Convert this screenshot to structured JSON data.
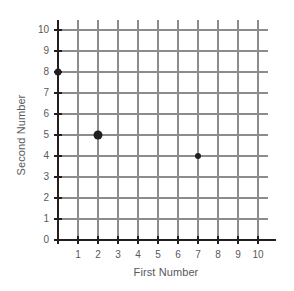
{
  "chart_data": {
    "type": "scatter",
    "title": "",
    "xlabel": "First Number",
    "ylabel": "Second Number",
    "xlim": [
      0,
      10
    ],
    "ylim": [
      0,
      10
    ],
    "xticks": [
      0,
      1,
      2,
      3,
      4,
      5,
      6,
      7,
      8,
      9,
      10
    ],
    "yticks": [
      0,
      1,
      2,
      3,
      4,
      5,
      6,
      7,
      8,
      9,
      10
    ],
    "xtick_labels": [
      "0",
      "1",
      "2",
      "3",
      "4",
      "5",
      "6",
      "7",
      "8",
      "9",
      "10"
    ],
    "ytick_labels": [
      "0",
      "1",
      "2",
      "3",
      "4",
      "5",
      "6",
      "7",
      "8",
      "9",
      "10"
    ],
    "grid": true,
    "legend": "none",
    "points": [
      {
        "x": 0,
        "y": 8,
        "marker": "filled-circle",
        "size": 7,
        "color": "#231f20",
        "label": "(0, 8)"
      },
      {
        "x": 2,
        "y": 5,
        "marker": "filled-circle",
        "size": 9,
        "color": "#231f20",
        "label": "(2, 5)"
      },
      {
        "x": 7,
        "y": 4,
        "marker": "filled-circle",
        "size": 6,
        "color": "#231f20",
        "label": "(7, 4)"
      }
    ],
    "series": [
      {
        "name": "points",
        "x": [
          0,
          2,
          7
        ],
        "values": [
          8,
          5,
          4
        ]
      }
    ],
    "colors": {
      "axis": "#231f20",
      "grid": "#8a8c8e",
      "marker": "#231f20",
      "text": "#58595b",
      "background": "#ffffff"
    }
  },
  "axes": {
    "x_title": "First Number",
    "y_title": "Second Number"
  }
}
